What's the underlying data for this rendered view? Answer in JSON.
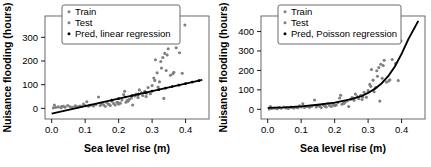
{
  "figure": {
    "background": "#ffffff",
    "point_color_train": "#808080",
    "point_color_test": "#808080",
    "line_color": "#000000"
  },
  "chart_data": [
    {
      "type": "scatter",
      "panel": "left",
      "title": "",
      "xlabel": "Sea level rise (m)",
      "ylabel": "Nuisance flooding (hours)",
      "xlim": [
        -0.02,
        0.47
      ],
      "ylim": [
        -45,
        390
      ],
      "xticks": [
        0.0,
        0.1,
        0.2,
        0.3,
        0.4
      ],
      "xticklabels": [
        "0.0",
        "0.1",
        "0.2",
        "0.3",
        "0.4"
      ],
      "yticks": [
        0,
        100,
        200,
        300
      ],
      "yticklabels": [
        "0",
        "100",
        "200",
        "300"
      ],
      "grid": false,
      "legend_position": "top-left",
      "legend": [
        {
          "label": "Train",
          "marker": "dot",
          "color": "#808080"
        },
        {
          "label": "Test",
          "marker": "dot",
          "color": "#808080"
        },
        {
          "label": "Pred, linear regression",
          "marker": "dot",
          "color": "#000000"
        }
      ],
      "series": [
        {
          "name": "Train",
          "marker": "dot",
          "color": "#808080",
          "points": [
            [
              0.005,
              2
            ],
            [
              0.008,
              14
            ],
            [
              0.012,
              4
            ],
            [
              0.02,
              6
            ],
            [
              0.028,
              3
            ],
            [
              0.035,
              9
            ],
            [
              0.04,
              5
            ],
            [
              0.048,
              12
            ],
            [
              0.055,
              7
            ],
            [
              0.062,
              4
            ],
            [
              0.07,
              11
            ],
            [
              0.078,
              6
            ],
            [
              0.085,
              10
            ],
            [
              0.09,
              8
            ],
            [
              0.095,
              18
            ],
            [
              0.1,
              12
            ],
            [
              0.105,
              28
            ],
            [
              0.11,
              9
            ],
            [
              0.118,
              14
            ],
            [
              0.125,
              10
            ],
            [
              0.132,
              16
            ],
            [
              0.14,
              48
            ],
            [
              0.145,
              12
            ],
            [
              0.15,
              20
            ],
            [
              0.155,
              15
            ],
            [
              0.16,
              9
            ],
            [
              0.165,
              24
            ],
            [
              0.17,
              17
            ],
            [
              0.175,
              12
            ],
            [
              0.18,
              30
            ],
            [
              0.185,
              20
            ],
            [
              0.19,
              14
            ],
            [
              0.195,
              26
            ],
            [
              0.2,
              18
            ],
            [
              0.205,
              22
            ],
            [
              0.21,
              35
            ],
            [
              0.215,
              58
            ],
            [
              0.218,
              72
            ],
            [
              0.222,
              26
            ],
            [
              0.228,
              30
            ],
            [
              0.232,
              38
            ],
            [
              0.238,
              44
            ],
            [
              0.242,
              14
            ],
            [
              0.248,
              52
            ],
            [
              0.252,
              60
            ],
            [
              0.258,
              46
            ],
            [
              0.262,
              78
            ],
            [
              0.268,
              66
            ],
            [
              0.272,
              54
            ],
            [
              0.278,
              72
            ],
            [
              0.282,
              50
            ],
            [
              0.288,
              88
            ],
            [
              0.295,
              62
            ],
            [
              0.3,
              96
            ],
            [
              0.305,
              128
            ],
            [
              0.31,
              205
            ],
            [
              0.315,
              150
            ],
            [
              0.318,
              90
            ],
            [
              0.322,
              112
            ],
            [
              0.328,
              170
            ],
            [
              0.332,
              215
            ],
            [
              0.335,
              42
            ],
            [
              0.338,
              232
            ],
            [
              0.342,
              160
            ],
            [
              0.348,
              252
            ],
            [
              0.355,
              140
            ],
            [
              0.362,
              146
            ],
            [
              0.372,
              256
            ],
            [
              0.382,
              235
            ],
            [
              0.398,
              352
            ]
          ]
        },
        {
          "name": "Test",
          "marker": "dot",
          "color": "#808080",
          "points": [
            [
              0.03,
              8
            ],
            [
              0.072,
              9
            ],
            [
              0.112,
              13
            ],
            [
              0.148,
              22
            ],
            [
              0.172,
              16
            ],
            [
              0.198,
              24
            ],
            [
              0.226,
              34
            ],
            [
              0.256,
              56
            ],
            [
              0.284,
              64
            ],
            [
              0.308,
              118
            ],
            [
              0.326,
              198
            ],
            [
              0.345,
              225
            ],
            [
              0.365,
              152
            ],
            [
              0.39,
              148
            ]
          ]
        },
        {
          "name": "Pred, linear regression",
          "marker": "line-with-dots",
          "color": "#000000",
          "fit": "linear",
          "line": [
            [
              0.0,
              -22
            ],
            [
              0.45,
              120
            ]
          ],
          "points": [
            [
              0.18,
              35
            ],
            [
              0.2,
              41
            ],
            [
              0.22,
              48
            ],
            [
              0.24,
              54
            ],
            [
              0.26,
              60
            ],
            [
              0.28,
              66
            ],
            [
              0.3,
              73
            ],
            [
              0.32,
              79
            ],
            [
              0.34,
              85
            ],
            [
              0.36,
              92
            ],
            [
              0.38,
              98
            ],
            [
              0.4,
              104
            ],
            [
              0.42,
              111
            ],
            [
              0.44,
              117
            ]
          ]
        }
      ]
    },
    {
      "type": "scatter",
      "panel": "right",
      "title": "",
      "xlabel": "Sea level rise (m)",
      "ylabel": "Nuisance flooding (hours)",
      "xlim": [
        -0.02,
        0.47
      ],
      "ylim": [
        -50,
        480
      ],
      "xticks": [
        0.0,
        0.1,
        0.2,
        0.3,
        0.4
      ],
      "xticklabels": [
        "0.0",
        "0.1",
        "0.2",
        "0.3",
        "0.4"
      ],
      "yticks": [
        0,
        100,
        200,
        300,
        400
      ],
      "yticklabels": [
        "0",
        "100",
        "200",
        "300",
        "400"
      ],
      "grid": false,
      "legend_position": "top-left",
      "legend": [
        {
          "label": "Train",
          "marker": "dot",
          "color": "#808080"
        },
        {
          "label": "Test",
          "marker": "dot",
          "color": "#808080"
        },
        {
          "label": "Pred, Poisson regression",
          "marker": "dot",
          "color": "#000000"
        }
      ],
      "series": [
        {
          "name": "Train",
          "marker": "dot",
          "color": "#808080",
          "points": [
            [
              0.005,
              2
            ],
            [
              0.008,
              14
            ],
            [
              0.012,
              4
            ],
            [
              0.02,
              6
            ],
            [
              0.028,
              3
            ],
            [
              0.035,
              9
            ],
            [
              0.04,
              5
            ],
            [
              0.048,
              12
            ],
            [
              0.055,
              7
            ],
            [
              0.062,
              4
            ],
            [
              0.07,
              11
            ],
            [
              0.078,
              6
            ],
            [
              0.085,
              10
            ],
            [
              0.09,
              8
            ],
            [
              0.095,
              18
            ],
            [
              0.1,
              12
            ],
            [
              0.105,
              28
            ],
            [
              0.11,
              9
            ],
            [
              0.118,
              14
            ],
            [
              0.125,
              10
            ],
            [
              0.132,
              16
            ],
            [
              0.14,
              48
            ],
            [
              0.145,
              12
            ],
            [
              0.15,
              20
            ],
            [
              0.155,
              15
            ],
            [
              0.16,
              9
            ],
            [
              0.165,
              24
            ],
            [
              0.17,
              17
            ],
            [
              0.175,
              12
            ],
            [
              0.18,
              30
            ],
            [
              0.185,
              20
            ],
            [
              0.19,
              14
            ],
            [
              0.195,
              26
            ],
            [
              0.2,
              18
            ],
            [
              0.205,
              22
            ],
            [
              0.21,
              35
            ],
            [
              0.215,
              58
            ],
            [
              0.218,
              72
            ],
            [
              0.222,
              26
            ],
            [
              0.228,
              30
            ],
            [
              0.232,
              38
            ],
            [
              0.238,
              44
            ],
            [
              0.242,
              14
            ],
            [
              0.248,
              52
            ],
            [
              0.252,
              60
            ],
            [
              0.258,
              46
            ],
            [
              0.262,
              78
            ],
            [
              0.268,
              66
            ],
            [
              0.272,
              54
            ],
            [
              0.278,
              72
            ],
            [
              0.282,
              50
            ],
            [
              0.288,
              88
            ],
            [
              0.295,
              62
            ],
            [
              0.3,
              96
            ],
            [
              0.305,
              128
            ],
            [
              0.31,
              205
            ],
            [
              0.315,
              150
            ],
            [
              0.318,
              90
            ],
            [
              0.322,
              112
            ],
            [
              0.328,
              170
            ],
            [
              0.332,
              215
            ],
            [
              0.335,
              42
            ],
            [
              0.338,
              232
            ],
            [
              0.342,
              160
            ],
            [
              0.348,
              252
            ],
            [
              0.355,
              140
            ],
            [
              0.362,
              146
            ],
            [
              0.372,
              256
            ],
            [
              0.382,
              235
            ],
            [
              0.398,
              352
            ]
          ]
        },
        {
          "name": "Test",
          "marker": "dot",
          "color": "#808080",
          "points": [
            [
              0.03,
              8
            ],
            [
              0.072,
              9
            ],
            [
              0.112,
              13
            ],
            [
              0.148,
              22
            ],
            [
              0.172,
              16
            ],
            [
              0.198,
              24
            ],
            [
              0.226,
              34
            ],
            [
              0.256,
              56
            ],
            [
              0.284,
              64
            ],
            [
              0.308,
              118
            ],
            [
              0.326,
              198
            ],
            [
              0.345,
              225
            ],
            [
              0.365,
              152
            ],
            [
              0.39,
              148
            ]
          ]
        },
        {
          "name": "Pred, Poisson regression",
          "marker": "curve",
          "color": "#000000",
          "fit": "poisson",
          "curve": [
            [
              0.0,
              7
            ],
            [
              0.05,
              10
            ],
            [
              0.1,
              15
            ],
            [
              0.15,
              23
            ],
            [
              0.2,
              34
            ],
            [
              0.25,
              52
            ],
            [
              0.28,
              68
            ],
            [
              0.3,
              84
            ],
            [
              0.32,
              105
            ],
            [
              0.34,
              133
            ],
            [
              0.36,
              170
            ],
            [
              0.38,
              220
            ],
            [
              0.4,
              285
            ],
            [
              0.42,
              360
            ],
            [
              0.45,
              455
            ]
          ]
        }
      ]
    }
  ]
}
